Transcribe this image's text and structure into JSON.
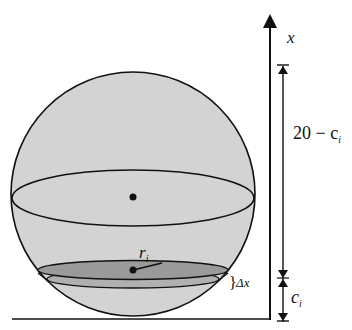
{
  "diagram": {
    "type": "sphere-slice-volume",
    "axis_label": "x",
    "upper_dimension_label": "20 − c",
    "upper_dimension_subscript": "i",
    "lower_dimension_label": "c",
    "lower_dimension_subscript": "i",
    "radius_label": "r",
    "radius_subscript": "i",
    "thickness_label": "Δx",
    "thickness_brace": "}",
    "colors": {
      "sphere_fill": "#d3d3d3",
      "slice_fill": "#9a9a9a",
      "slice_lower_fill": "#b0b0b0",
      "stroke": "#111111",
      "background": "#ffffff"
    }
  }
}
